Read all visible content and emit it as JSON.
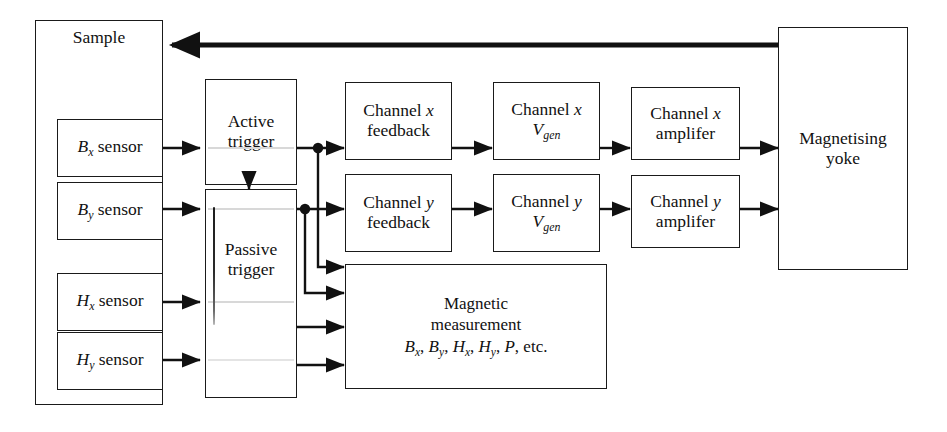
{
  "figure": {
    "background_color": "#ffffff",
    "line_color": "#111111"
  },
  "nodes": {
    "sample": {
      "label": "Sample"
    },
    "b_x_sensor": {
      "label": "B",
      "sub": "x",
      "tail": " sensor"
    },
    "b_y_sensor": {
      "label": "B",
      "sub": "y",
      "tail": " sensor"
    },
    "h_x_sensor": {
      "label": "H",
      "sub": "x",
      "tail": " sensor"
    },
    "h_y_sensor": {
      "label": "H",
      "sub": "y",
      "tail": " sensor"
    },
    "active_trigger": {
      "line1": "Active",
      "line2": "trigger"
    },
    "passive_trigger": {
      "line1": "Passive",
      "line2": "trigger"
    },
    "channel_x_feedback": {
      "line1": "Channel ",
      "var1": "x",
      "line2": "feedback"
    },
    "channel_y_feedback": {
      "line1": "Channel ",
      "var1": "y",
      "line2": "feedback"
    },
    "channel_x_vgen": {
      "line1": "Channel ",
      "var1": "x",
      "line2": "V",
      "sub2": "gen"
    },
    "channel_y_vgen": {
      "line1": "Channel ",
      "var1": "y",
      "line2": "V",
      "sub2": "gen"
    },
    "channel_x_amplifier": {
      "line1": "Channel ",
      "var1": "x",
      "line2": "amplifer"
    },
    "channel_y_amplifier": {
      "line1": "Channel ",
      "var1": "y",
      "line2": "amplifer"
    },
    "magnetic_measurement": {
      "line1": "Magnetic",
      "line2": "measurement",
      "line3_parts": [
        "B",
        "x",
        ", ",
        "B",
        "y",
        ", ",
        "H",
        "x",
        ", ",
        "H",
        "y",
        ", ",
        "P",
        ", etc."
      ]
    },
    "magnetising_yoke": {
      "line1": "Magnetising",
      "line2": "yoke"
    }
  },
  "connections": [
    {
      "from": "b_x_sensor",
      "to": "active_trigger",
      "style": "thin-arrow"
    },
    {
      "from": "b_y_sensor",
      "to": "passive_trigger",
      "style": "thin-arrow"
    },
    {
      "from": "h_x_sensor",
      "to": "passive_trigger",
      "style": "thin-arrow"
    },
    {
      "from": "h_y_sensor",
      "to": "passive_trigger",
      "style": "thin-arrow"
    },
    {
      "from": "active_trigger",
      "to": "passive_trigger",
      "style": "thin-arrow-down"
    },
    {
      "from": "active_trigger",
      "to": "channel_x_feedback",
      "style": "thin-arrow-junction"
    },
    {
      "from": "active_trigger",
      "to": "magnetic_measurement",
      "style": "thin-arrow-routed"
    },
    {
      "from": "passive_trigger",
      "to": "channel_y_feedback",
      "style": "thin-arrow-junction"
    },
    {
      "from": "passive_trigger",
      "to": "magnetic_measurement",
      "style": "thin-arrow-routed"
    },
    {
      "from": "passive_trigger",
      "to": "magnetic_measurement",
      "style": "thin-arrow"
    },
    {
      "from": "channel_x_feedback",
      "to": "channel_x_vgen",
      "style": "thin-arrow"
    },
    {
      "from": "channel_y_feedback",
      "to": "channel_y_vgen",
      "style": "thin-arrow"
    },
    {
      "from": "channel_x_vgen",
      "to": "channel_x_amplifier",
      "style": "thin-arrow"
    },
    {
      "from": "channel_y_vgen",
      "to": "channel_y_amplifier",
      "style": "thin-arrow"
    },
    {
      "from": "channel_x_amplifier",
      "to": "magnetising_yoke",
      "style": "thin-arrow"
    },
    {
      "from": "channel_y_amplifier",
      "to": "magnetising_yoke",
      "style": "thin-arrow"
    },
    {
      "from": "magnetising_yoke",
      "to": "sample",
      "style": "thick-arrow"
    }
  ]
}
